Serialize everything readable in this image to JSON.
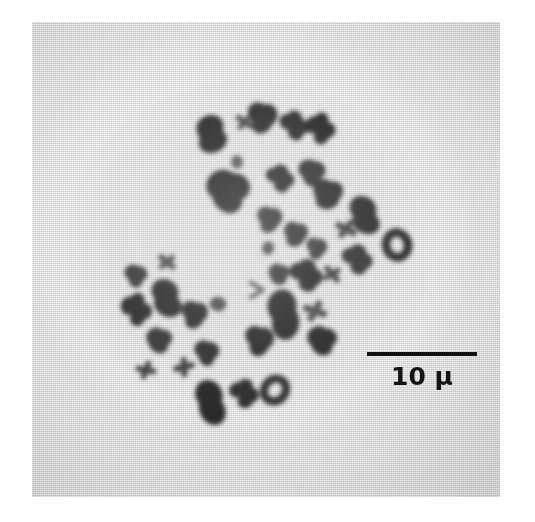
{
  "figure": {
    "kind": "photomicrograph",
    "caption_text": "",
    "page_background": "#ffffff"
  },
  "micrograph": {
    "name": "metaphase-spread-micrograph",
    "background_color": "#dcdcdc",
    "stain_color": "#1a1a1a",
    "alt_text": "Grayscale light micrograph of a metaphase chromosome spread showing dark-stained chromosomes scattered across a pale grey field",
    "plate_left": 32,
    "plate_top": 22,
    "plate_width": 468,
    "plate_height": 475
  },
  "scale_bar": {
    "name": "scale-bar",
    "label": "10 µ",
    "value": 10,
    "unit": "µ",
    "bar_length_px": 110,
    "bar_color": "#111111",
    "label_color": "#141414"
  },
  "chart_data": {
    "type": "scatter",
    "title": "",
    "xlabel": "",
    "ylabel": "",
    "legend": [],
    "grid": false,
    "xlim": [
      0,
      468
    ],
    "ylim": [
      0,
      475
    ],
    "point_count": 39,
    "points": [
      {
        "id": 1,
        "x": 178,
        "y": 112,
        "size": 30,
        "shape": "rod",
        "tone": "#161616"
      },
      {
        "id": 2,
        "x": 213,
        "y": 100,
        "size": 20,
        "shape": "cross",
        "tone": "#3a3a3a"
      },
      {
        "id": 3,
        "x": 231,
        "y": 95,
        "size": 27,
        "shape": "blob",
        "tone": "#1d1d1d"
      },
      {
        "id": 4,
        "x": 205,
        "y": 140,
        "size": 13,
        "shape": "dot",
        "tone": "#4a4a4a"
      },
      {
        "id": 5,
        "x": 262,
        "y": 104,
        "size": 25,
        "shape": "hook",
        "tone": "#1b1b1b"
      },
      {
        "id": 6,
        "x": 288,
        "y": 107,
        "size": 26,
        "shape": "hook",
        "tone": "#181818"
      },
      {
        "id": 7,
        "x": 196,
        "y": 168,
        "size": 38,
        "shape": "blob",
        "tone": "#141414"
      },
      {
        "id": 8,
        "x": 248,
        "y": 157,
        "size": 24,
        "shape": "hook",
        "tone": "#1f1f1f"
      },
      {
        "id": 9,
        "x": 280,
        "y": 150,
        "size": 24,
        "shape": "blob",
        "tone": "#222222"
      },
      {
        "id": 10,
        "x": 296,
        "y": 172,
        "size": 27,
        "shape": "blob",
        "tone": "#1a1a1a"
      },
      {
        "id": 11,
        "x": 238,
        "y": 197,
        "size": 23,
        "shape": "blob",
        "tone": "#232323"
      },
      {
        "id": 12,
        "x": 264,
        "y": 212,
        "size": 22,
        "shape": "blob",
        "tone": "#242424"
      },
      {
        "id": 13,
        "x": 236,
        "y": 226,
        "size": 13,
        "shape": "dot",
        "tone": "#3a3a3a"
      },
      {
        "id": 14,
        "x": 285,
        "y": 226,
        "size": 19,
        "shape": "blob",
        "tone": "#2a2a2a"
      },
      {
        "id": 15,
        "x": 247,
        "y": 252,
        "size": 19,
        "shape": "blob",
        "tone": "#282828"
      },
      {
        "id": 16,
        "x": 274,
        "y": 254,
        "size": 28,
        "shape": "hook",
        "tone": "#151515"
      },
      {
        "id": 17,
        "x": 300,
        "y": 252,
        "size": 20,
        "shape": "cross",
        "tone": "#2d2d2d"
      },
      {
        "id": 18,
        "x": 226,
        "y": 268,
        "size": 16,
        "shape": "chevron",
        "tone": "#4d4d4d"
      },
      {
        "id": 19,
        "x": 283,
        "y": 289,
        "size": 24,
        "shape": "cross",
        "tone": "#3a3a3a"
      },
      {
        "id": 20,
        "x": 250,
        "y": 292,
        "size": 36,
        "shape": "rod",
        "tone": "#121212"
      },
      {
        "id": 21,
        "x": 228,
        "y": 318,
        "size": 26,
        "shape": "blob",
        "tone": "#161616"
      },
      {
        "id": 22,
        "x": 290,
        "y": 318,
        "size": 26,
        "shape": "blob",
        "tone": "#171717"
      },
      {
        "id": 23,
        "x": 331,
        "y": 193,
        "size": 30,
        "shape": "rod",
        "tone": "#1e1e1e"
      },
      {
        "id": 24,
        "x": 314,
        "y": 207,
        "size": 22,
        "shape": "cross",
        "tone": "#333333"
      },
      {
        "id": 25,
        "x": 365,
        "y": 223,
        "size": 25,
        "shape": "ring",
        "tone": "#1d1d1d"
      },
      {
        "id": 26,
        "x": 325,
        "y": 238,
        "size": 26,
        "shape": "hook",
        "tone": "#222222"
      },
      {
        "id": 27,
        "x": 104,
        "y": 253,
        "size": 20,
        "shape": "blob",
        "tone": "#2a2a2a"
      },
      {
        "id": 28,
        "x": 135,
        "y": 240,
        "size": 20,
        "shape": "cross",
        "tone": "#3d3d3d"
      },
      {
        "id": 29,
        "x": 104,
        "y": 288,
        "size": 27,
        "shape": "hook",
        "tone": "#1c1c1c"
      },
      {
        "id": 30,
        "x": 133,
        "y": 276,
        "size": 30,
        "shape": "rod",
        "tone": "#1a1a1a"
      },
      {
        "id": 31,
        "x": 163,
        "y": 292,
        "size": 24,
        "shape": "blob",
        "tone": "#1e1e1e"
      },
      {
        "id": 32,
        "x": 186,
        "y": 282,
        "size": 16,
        "shape": "dot",
        "tone": "#3c3c3c"
      },
      {
        "id": 33,
        "x": 127,
        "y": 318,
        "size": 23,
        "shape": "blob",
        "tone": "#282828"
      },
      {
        "id": 34,
        "x": 152,
        "y": 345,
        "size": 21,
        "shape": "cross",
        "tone": "#2f2f2f"
      },
      {
        "id": 35,
        "x": 114,
        "y": 348,
        "size": 20,
        "shape": "cross",
        "tone": "#323232"
      },
      {
        "id": 36,
        "x": 175,
        "y": 330,
        "size": 22,
        "shape": "blob",
        "tone": "#1f1f1f"
      },
      {
        "id": 37,
        "x": 177,
        "y": 380,
        "size": 33,
        "shape": "rod",
        "tone": "#141414"
      },
      {
        "id": 38,
        "x": 212,
        "y": 372,
        "size": 25,
        "shape": "hook",
        "tone": "#1b1b1b"
      },
      {
        "id": 39,
        "x": 243,
        "y": 368,
        "size": 24,
        "shape": "ring",
        "tone": "#202020"
      }
    ]
  }
}
